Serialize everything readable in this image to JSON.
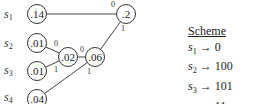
{
  "symbols": [
    {
      "name": "s",
      "sub": "1",
      "x": 4,
      "y": 18
    },
    {
      "name": "s",
      "sub": "2",
      "x": 4,
      "y": 47
    },
    {
      "name": "s",
      "sub": "3",
      "x": 4,
      "y": 74
    },
    {
      "name": "s",
      "sub": "4",
      "x": 4,
      "y": 101
    }
  ],
  "nodes": [
    {
      "id": "n14",
      "label": ".14",
      "x": 37,
      "y": 14
    },
    {
      "id": "n01a",
      "label": ".01",
      "x": 37,
      "y": 43
    },
    {
      "id": "n01b",
      "label": ".01",
      "x": 37,
      "y": 71
    },
    {
      "id": "n04",
      "label": ".04",
      "x": 37,
      "y": 99
    },
    {
      "id": "n02",
      "label": ".02",
      "x": 68,
      "y": 57
    },
    {
      "id": "n06",
      "label": ".06",
      "x": 95,
      "y": 57
    },
    {
      "id": "n2",
      "label": ".2",
      "x": 126,
      "y": 14
    }
  ],
  "edges": [
    {
      "from": "n14",
      "to": "n2",
      "bit": "0",
      "bx": 113,
      "by": 7
    },
    {
      "from": "n06",
      "to": "n2",
      "bit": "1",
      "bx": 123,
      "by": 31
    },
    {
      "from": "n01a",
      "to": "n02",
      "bit": "0",
      "bx": 56,
      "by": 46
    },
    {
      "from": "n01b",
      "to": "n02",
      "bit": "1",
      "bx": 56,
      "by": 72
    },
    {
      "from": "n02",
      "to": "n06",
      "bit": "0",
      "bx": 82,
      "by": 52
    },
    {
      "from": "n04",
      "to": "n06",
      "bit": "1",
      "bx": 89,
      "by": 74
    }
  ],
  "scheme": {
    "title": "Scheme",
    "rows": [
      {
        "sym": "s",
        "sub": "1",
        "arrow": "→",
        "code": "0"
      },
      {
        "sym": "s",
        "sub": "2",
        "arrow": "→",
        "code": "100"
      },
      {
        "sym": "s",
        "sub": "3",
        "arrow": "→",
        "code": "101"
      },
      {
        "sym": "s",
        "sub": "4",
        "arrow": "→",
        "code": "11"
      }
    ]
  }
}
